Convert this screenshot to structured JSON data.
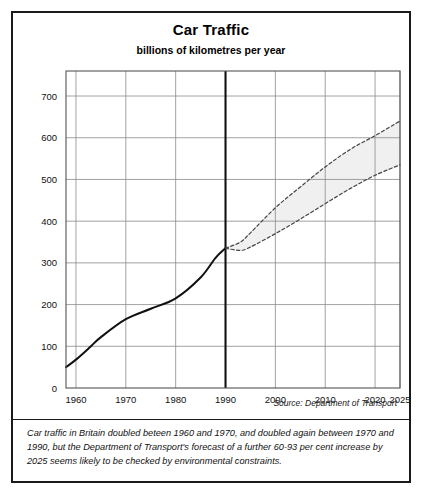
{
  "figure": {
    "title": "Car Traffic",
    "subtitle": "billions of kilometres per year",
    "source": "Source: Department of Transport",
    "caption": "Car traffic in Britain doubled beteen 1960 and 1970, and doubled again between 1970 and 1990, but the Department of Transport's forecast of a further 60-93 per cent increase by 2025 seems likely to be checked by environmental constraints."
  },
  "chart_data": {
    "type": "line",
    "title": "Car Traffic",
    "subtitle": "billions of kilometres per year",
    "xlabel": "",
    "ylabel": "billions of kilometres per year",
    "xlim": [
      1958,
      2025
    ],
    "ylim": [
      0,
      760
    ],
    "xticks": [
      1960,
      1970,
      1980,
      1990,
      2000,
      2010,
      2020,
      2025
    ],
    "xtick_labels": [
      "1960",
      "1970",
      "1980",
      "1990",
      "2000",
      "2010",
      "2020",
      "2025"
    ],
    "yticks": [
      0,
      100,
      200,
      300,
      400,
      500,
      600,
      700
    ],
    "ytick_labels": [
      "0",
      "100",
      "200",
      "300",
      "400",
      "500",
      "600",
      "700"
    ],
    "grid": true,
    "legend": "none",
    "forecast_divider_year": 1990,
    "shaded_band": {
      "between": [
        "forecast-high",
        "forecast-low"
      ],
      "color": "#f0f0f0",
      "from_year": 1990,
      "to_year": 2025
    },
    "series": [
      {
        "name": "Actual car traffic",
        "style": "solid",
        "color": "#111111",
        "points": [
          [
            1958,
            50
          ],
          [
            1960,
            68
          ],
          [
            1963,
            100
          ],
          [
            1965,
            122
          ],
          [
            1970,
            165
          ],
          [
            1975,
            190
          ],
          [
            1980,
            215
          ],
          [
            1985,
            265
          ],
          [
            1988,
            312
          ],
          [
            1990,
            335
          ]
        ]
      },
      {
        "name": "Forecast high",
        "style": "dashed",
        "color": "#444444",
        "points": [
          [
            1990,
            335
          ],
          [
            1993,
            350
          ],
          [
            1995,
            372
          ],
          [
            2000,
            432
          ],
          [
            2005,
            482
          ],
          [
            2010,
            530
          ],
          [
            2015,
            572
          ],
          [
            2020,
            605
          ],
          [
            2025,
            640
          ]
        ]
      },
      {
        "name": "Forecast low",
        "style": "dashed",
        "color": "#444444",
        "points": [
          [
            1990,
            335
          ],
          [
            1993,
            330
          ],
          [
            1995,
            338
          ],
          [
            2000,
            370
          ],
          [
            2005,
            405
          ],
          [
            2010,
            442
          ],
          [
            2015,
            478
          ],
          [
            2020,
            510
          ],
          [
            2025,
            535
          ]
        ]
      }
    ]
  }
}
